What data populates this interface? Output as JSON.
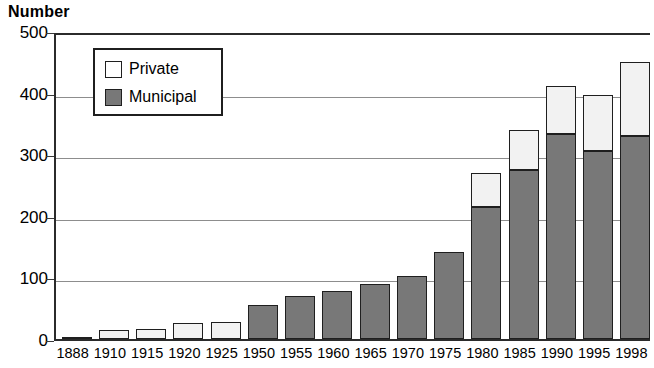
{
  "chart_data": {
    "type": "bar",
    "stacked": true,
    "title": "Number",
    "xlabel": "",
    "ylabel": "Number",
    "ylim": [
      0,
      500
    ],
    "ytick_step": 100,
    "yticks": [
      0,
      100,
      200,
      300,
      400,
      500
    ],
    "grid": true,
    "legend_position": "top-left-inside",
    "categories": [
      "1888",
      "1910",
      "1915",
      "1920",
      "1925",
      "1950",
      "1955",
      "1960",
      "1965",
      "1970",
      "1975",
      "1980",
      "1985",
      "1990",
      "1995",
      "1998"
    ],
    "series": [
      {
        "name": "Municipal",
        "color": "#787878",
        "values": [
          0,
          0,
          0,
          0,
          0,
          55,
          70,
          78,
          90,
          102,
          141,
          215,
          274,
          333,
          306,
          330
        ]
      },
      {
        "name": "Private",
        "color": "#ffffff",
        "values": [
          1,
          15,
          17,
          26,
          27,
          0,
          0,
          0,
          0,
          0,
          0,
          55,
          66,
          77,
          90,
          120
        ]
      }
    ],
    "totals": [
      1,
      15,
      17,
      26,
      27,
      55,
      70,
      78,
      90,
      102,
      141,
      270,
      340,
      410,
      396,
      450
    ]
  },
  "axis": {
    "y_title": "Number",
    "y_tick_labels": [
      "500",
      "400",
      "300",
      "200",
      "100",
      "0"
    ],
    "x_tick_labels": [
      "1888",
      "1910",
      "1915",
      "1920",
      "1925",
      "1950",
      "1955",
      "1960",
      "1965",
      "1970",
      "1975",
      "1980",
      "1985",
      "1990",
      "1995",
      "1998"
    ]
  },
  "legend": {
    "items": [
      {
        "label": "Private",
        "swatch": "private"
      },
      {
        "label": "Municipal",
        "swatch": "municipal"
      }
    ]
  }
}
